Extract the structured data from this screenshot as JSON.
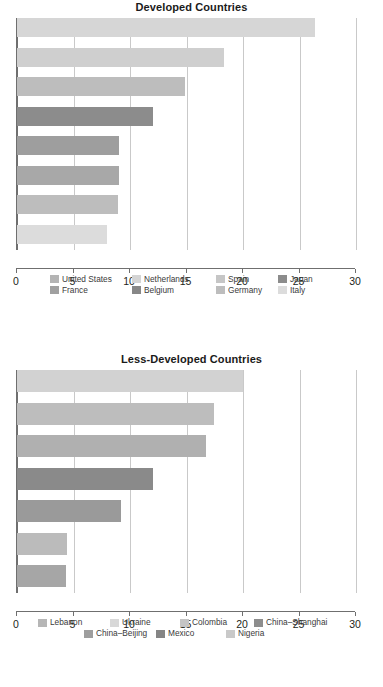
{
  "figure": {
    "panels": [
      {
        "id": "developed",
        "title": "Developed Countries"
      },
      {
        "id": "less-developed",
        "title": "Less-Developed Countries"
      }
    ]
  },
  "chart_data": [
    {
      "type": "bar",
      "orientation": "horizontal",
      "title": "Developed Countries",
      "xlabel": "",
      "ylabel": "",
      "xlim": [
        0,
        30
      ],
      "xticks": [
        0,
        5,
        10,
        15,
        20,
        25,
        30
      ],
      "xticklabels": [
        "0",
        "5",
        "10",
        "15",
        "20",
        "25",
        "30"
      ],
      "grid": "vertical",
      "legend_position": "bottom",
      "legend_columns": 4,
      "categories": [
        "United States",
        "Netherlands",
        "Spain",
        "Japan",
        "France",
        "Belgium",
        "Germany",
        "Italy"
      ],
      "values": [
        26.4,
        18.3,
        14.9,
        12.0,
        9.0,
        9.0,
        8.9,
        8.0
      ],
      "colors": [
        "#d6d6d6",
        "#cfcfcf",
        "#bdbdbd",
        "#8c8c8c",
        "#9e9e9e",
        "#a8a8a8",
        "#bdbdbd",
        "#dcdcdc"
      ],
      "legend_order": [
        "United States",
        "Netherlands",
        "Spain",
        "Japan",
        "France",
        "Belgium",
        "Germany",
        "Italy"
      ]
    },
    {
      "type": "bar",
      "orientation": "horizontal",
      "title": "Less-Developed Countries",
      "xlabel": "",
      "ylabel": "",
      "xlim": [
        0,
        30
      ],
      "xticks": [
        0,
        5,
        10,
        15,
        20,
        25,
        30
      ],
      "xticklabels": [
        "0",
        "5",
        "10",
        "15",
        "20",
        "25",
        "30"
      ],
      "grid": "vertical",
      "legend_position": "bottom",
      "legend_columns": 4,
      "categories": [
        "Lebanon",
        "Ukraine",
        "Colombia",
        "China–Shanghai",
        "China–Beijing",
        "Mexico",
        "Nigeria"
      ],
      "values": [
        20.0,
        17.4,
        16.7,
        12.0,
        9.2,
        4.4,
        4.3
      ],
      "colors": [
        "#d2d2d2",
        "#bdbdbd",
        "#b0b0b0",
        "#8a8a8a",
        "#9a9a9a",
        "#bbbbbb",
        "#a6a6a6"
      ],
      "legend_order": [
        "Lebanon",
        "Ukraine",
        "Colombia",
        "China–Shanghai",
        "China–Beijing",
        "Mexico",
        "Nigeria"
      ]
    }
  ],
  "legends": [
    {
      "rows": [
        [
          {
            "label": "United States",
            "color": "#b4b4b4"
          },
          {
            "label": "Netherlands",
            "color": "#d4d4d4"
          },
          {
            "label": "Spain",
            "color": "#c6c6c6"
          },
          {
            "label": "Japan",
            "color": "#8c8c8c"
          }
        ],
        [
          {
            "label": "France",
            "color": "#a0a0a0"
          },
          {
            "label": "Belgium",
            "color": "#878787"
          },
          {
            "label": "Germany",
            "color": "#bdbdbd"
          },
          {
            "label": "Italy",
            "color": "#dcdcdc"
          }
        ]
      ]
    },
    {
      "rows": [
        [
          {
            "label": "Lebanon",
            "color": "#b6b6b6"
          },
          {
            "label": "Ukraine",
            "color": "#d8d8d8"
          },
          {
            "label": "Colombia",
            "color": "#c4c4c4"
          },
          {
            "label": "China–Shanghai",
            "color": "#8d8d8d"
          }
        ],
        [
          {
            "label": "China–Beijing",
            "color": "#9e9e9e"
          },
          {
            "label": "Mexico",
            "color": "#858585"
          },
          {
            "label": "Nigeria",
            "color": "#c9c9c9"
          }
        ]
      ]
    }
  ],
  "style": {
    "axis_color": "#6f6f6f",
    "grid_color": "#c9c9c9",
    "text_color": "#231f20",
    "background": "#ffffff"
  }
}
